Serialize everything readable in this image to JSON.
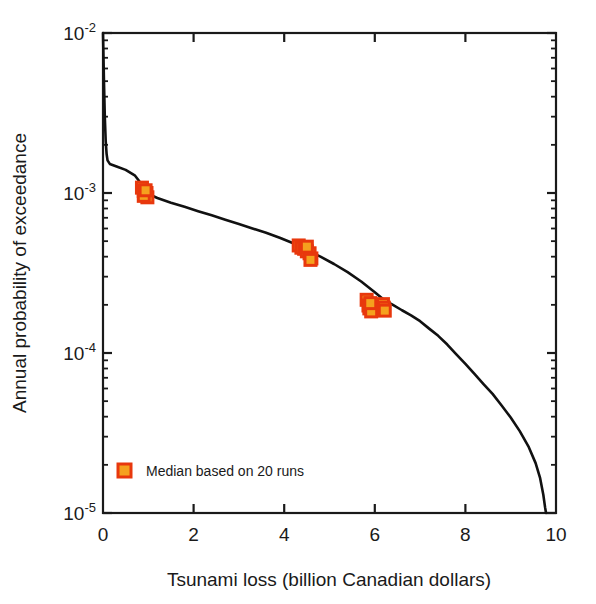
{
  "chart_data": {
    "type": "line",
    "title": "",
    "xlabel": "Tsunami loss (billion Canadian dollars)",
    "ylabel": "Annual probability of exceedance",
    "xlim": [
      0,
      10
    ],
    "ylim": [
      1e-05,
      0.01
    ],
    "yscale": "log",
    "xscale": "linear",
    "grid": false,
    "legend_position": "lower left",
    "xticks": [
      0,
      2,
      4,
      6,
      8,
      10
    ],
    "xtick_labels": [
      "0",
      "2",
      "4",
      "6",
      "8",
      "10"
    ],
    "yticks": [
      0.01,
      0.001,
      0.0001,
      1e-05
    ],
    "ytick_labels": [
      "10-2",
      "10-3",
      "10-4",
      "10-5"
    ],
    "ytick_mantissa": "10",
    "ytick_exponents": [
      "-2",
      "-3",
      "-4",
      "-5"
    ],
    "series": [
      {
        "name": "Exceedance curve",
        "type": "line",
        "color": "#111111",
        "linewidth": 2.6,
        "points": [
          [
            0.0,
            0.01
          ],
          [
            0.02,
            0.0052
          ],
          [
            0.04,
            0.003
          ],
          [
            0.06,
            0.0021
          ],
          [
            0.08,
            0.00175
          ],
          [
            0.1,
            0.0016
          ],
          [
            0.15,
            0.00152
          ],
          [
            0.3,
            0.001465
          ],
          [
            0.5,
            0.001395
          ],
          [
            0.7,
            0.00129
          ],
          [
            0.9,
            0.00109
          ],
          [
            1.0,
            0.000985
          ],
          [
            1.2,
            0.00093
          ],
          [
            1.5,
            0.00087
          ],
          [
            1.8,
            0.00082
          ],
          [
            2.1,
            0.00077
          ],
          [
            2.4,
            0.000725
          ],
          [
            2.7,
            0.00068
          ],
          [
            3.0,
            0.00064
          ],
          [
            3.3,
            0.0006
          ],
          [
            3.6,
            0.000565
          ],
          [
            3.9,
            0.000525
          ],
          [
            4.2,
            0.000485
          ],
          [
            4.5,
            0.00044
          ],
          [
            4.8,
            0.0004
          ],
          [
            5.1,
            0.00036
          ],
          [
            5.4,
            0.00032
          ],
          [
            5.7,
            0.00028
          ],
          [
            6.0,
            0.00024
          ],
          [
            6.2,
            0.000215
          ],
          [
            6.4,
            0.0002
          ],
          [
            6.6,
            0.000185
          ],
          [
            6.8,
            0.000172
          ],
          [
            7.0,
            0.000158
          ],
          [
            7.2,
            0.000142
          ],
          [
            7.4,
            0.000128
          ],
          [
            7.6,
            0.000113
          ],
          [
            7.8,
            9.8e-05
          ],
          [
            8.0,
            8.55e-05
          ],
          [
            8.2,
            7.4e-05
          ],
          [
            8.4,
            6.4e-05
          ],
          [
            8.6,
            5.55e-05
          ],
          [
            8.8,
            4.7e-05
          ],
          [
            9.0,
            3.95e-05
          ],
          [
            9.2,
            3.25e-05
          ],
          [
            9.4,
            2.58e-05
          ],
          [
            9.55,
            2.05e-05
          ],
          [
            9.65,
            1.65e-05
          ],
          [
            9.72,
            1.3e-05
          ],
          [
            9.76,
            1.08e-05
          ],
          [
            9.78,
            1e-05
          ]
        ]
      },
      {
        "name": "Median based on 20 runs",
        "type": "scatter",
        "marker": "square",
        "facecolor": "#F5A11E",
        "edgecolor": "#E8380D",
        "size": 11,
        "points": [
          [
            0.86,
            0.00108
          ],
          [
            0.9,
            0.00103
          ],
          [
            0.92,
            0.001
          ],
          [
            0.94,
            0.00097
          ],
          [
            0.96,
            0.001
          ],
          [
            0.98,
            0.00094
          ],
          [
            0.9,
            0.00096
          ],
          [
            0.94,
            0.00104
          ],
          [
            4.32,
            0.00047
          ],
          [
            4.38,
            0.000455
          ],
          [
            4.44,
            0.000448
          ],
          [
            4.5,
            0.000432
          ],
          [
            4.56,
            0.00042
          ],
          [
            4.5,
            0.000462
          ],
          [
            4.6,
            0.00039
          ],
          [
            4.58,
            0.000382
          ],
          [
            5.82,
            0.000215
          ],
          [
            5.86,
            0.000198
          ],
          [
            5.88,
            0.00019
          ],
          [
            5.92,
            0.000182
          ],
          [
            5.9,
            0.000205
          ],
          [
            6.18,
            0.000202
          ],
          [
            6.2,
            0.000192
          ],
          [
            6.22,
            0.000184
          ]
        ]
      }
    ],
    "legend": [
      {
        "label": "Median based on 20 runs",
        "marker": "square",
        "facecolor": "#F5A11E",
        "edgecolor": "#E8380D"
      }
    ]
  },
  "colors": {
    "curve": "#111111",
    "marker_face": "#F5A11E",
    "marker_edge": "#E8380D",
    "axis": "#1a1a1a",
    "background": "#ffffff"
  }
}
